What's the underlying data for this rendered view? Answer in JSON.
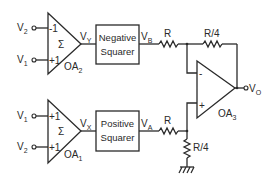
{
  "diagram": {
    "type": "circuit",
    "colors": {
      "line": "#2a2a2a",
      "background": "#ffffff"
    },
    "opamps": [
      {
        "id": "OA2",
        "label_main": "OA",
        "label_sub": "2",
        "symbol": "Σ",
        "inputs": [
          {
            "signal_main": "V",
            "signal_sub": "2",
            "gain": "-1"
          },
          {
            "signal_main": "V",
            "signal_sub": "1",
            "gain": "+1"
          }
        ],
        "output": {
          "main": "V",
          "sub": "Y"
        }
      },
      {
        "id": "OA1",
        "label_main": "OA",
        "label_sub": "1",
        "symbol": "Σ",
        "inputs": [
          {
            "signal_main": "V",
            "signal_sub": "1",
            "gain": "+1"
          },
          {
            "signal_main": "V",
            "signal_sub": "2",
            "gain": "+1"
          }
        ],
        "output": {
          "main": "V",
          "sub": "X"
        }
      },
      {
        "id": "OA3",
        "label_main": "OA",
        "label_sub": "3",
        "inverting": "-",
        "noninverting": "+",
        "output": {
          "main": "V",
          "sub": "O"
        }
      }
    ],
    "blocks": [
      {
        "id": "neg_squarer",
        "line1": "Negative",
        "line2": "Squarer",
        "output": {
          "main": "V",
          "sub": "B"
        }
      },
      {
        "id": "pos_squarer",
        "line1": "Positive",
        "line2": "Squarer",
        "output": {
          "main": "V",
          "sub": "A"
        }
      }
    ],
    "resistors": [
      {
        "id": "R_top_in",
        "label": "R"
      },
      {
        "id": "R_top_fb",
        "label": "R/4"
      },
      {
        "id": "R_bot_in",
        "label": "R"
      },
      {
        "id": "R_bot_gnd",
        "label": "R/4"
      }
    ]
  }
}
